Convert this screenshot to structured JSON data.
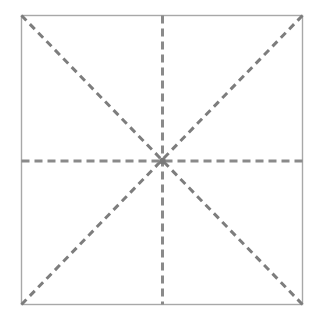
{
  "figure": {
    "name": "square-with-diagonal-and-median-fold-lines",
    "caption": "",
    "background_color": "#ffffff",
    "width": 316,
    "height": 321
  },
  "square": {
    "name": "outer-square",
    "stroke_color": "#a8a8a8",
    "stroke_width": 1.4,
    "fill": "none",
    "x": 21.5,
    "y": 15.5,
    "width": 281,
    "height": 289,
    "corners": {
      "top_left": [
        21.5,
        15.5
      ],
      "top_right": [
        302.5,
        15.5
      ],
      "bottom_right": [
        302.5,
        304.5
      ],
      "bottom_left": [
        21.5,
        304.5
      ]
    }
  },
  "center": {
    "name": "center-point",
    "x": 162.5,
    "y": 161,
    "color": "#7a7a7a",
    "radius": 3.2
  },
  "fold_lines": [
    {
      "name": "vertical-median",
      "orientation": "vertical",
      "x1": 162.5,
      "y1": 15.5,
      "x2": 162.5,
      "y2": 304.5,
      "stroke_color": "#8a8a8a",
      "stroke_width": 3,
      "dash": "8 5"
    },
    {
      "name": "horizontal-median",
      "orientation": "horizontal",
      "x1": 21.5,
      "y1": 161,
      "x2": 302.5,
      "y2": 161,
      "stroke_color": "#8a8a8a",
      "stroke_width": 3,
      "dash": "8 5"
    },
    {
      "name": "diagonal-top-left-to-bottom-right",
      "orientation": "diagonal",
      "x1": 21.5,
      "y1": 15.5,
      "x2": 302.5,
      "y2": 304.5,
      "stroke_color": "#7d7d7d",
      "stroke_width": 3,
      "dash": "7 5"
    },
    {
      "name": "diagonal-bottom-left-to-top-right",
      "orientation": "diagonal",
      "x1": 21.5,
      "y1": 304.5,
      "x2": 302.5,
      "y2": 15.5,
      "stroke_color": "#7d7d7d",
      "stroke_width": 3,
      "dash": "7 5"
    }
  ],
  "labels": {
    "figure_title": "",
    "alt_text": "Square outline with four dashed fold lines: two medians and two diagonals meeting at the center"
  }
}
